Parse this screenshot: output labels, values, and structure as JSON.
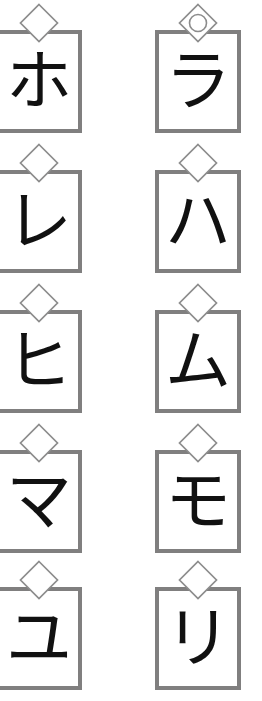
{
  "page": {
    "background_color": "#ffffff",
    "box_border_color": "#807f7f",
    "box_fill_color": "#ffffff",
    "glyph_color": "#111111",
    "marker_stroke_color": "#8c8c8c",
    "columns": 2,
    "rows": 5
  },
  "columns": [
    {
      "name": "left-column",
      "cards": [
        {
          "character": "ホ",
          "romaji": "ho",
          "marker": "diamond"
        },
        {
          "character": "レ",
          "romaji": "re",
          "marker": "diamond"
        },
        {
          "character": "ヒ",
          "romaji": "hi",
          "marker": "diamond"
        },
        {
          "character": "マ",
          "romaji": "ma",
          "marker": "diamond"
        },
        {
          "character": "ユ",
          "romaji": "yu",
          "marker": "diamond"
        }
      ]
    },
    {
      "name": "right-column",
      "cards": [
        {
          "character": "ラ",
          "romaji": "ra",
          "marker": "diamond-with-circle"
        },
        {
          "character": "ハ",
          "romaji": "ha",
          "marker": "diamond"
        },
        {
          "character": "ム",
          "romaji": "mu",
          "marker": "diamond"
        },
        {
          "character": "モ",
          "romaji": "mo",
          "marker": "diamond"
        },
        {
          "character": "リ",
          "romaji": "ri",
          "marker": "diamond"
        }
      ]
    }
  ],
  "layout": {
    "row_pitch": 140,
    "row_tops": [
      0,
      140,
      280,
      420,
      557
    ],
    "card_width": 86,
    "card_height": 103,
    "border_width": 4,
    "marker_size": 44
  }
}
